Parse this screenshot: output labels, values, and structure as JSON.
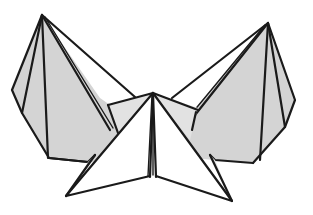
{
  "diagram": {
    "colors": {
      "background": "#ffffff",
      "shaded_face": "#d4d4d4",
      "light_face": "#e2e2e2",
      "white_face": "#ffffff",
      "line": "#1a1a1a"
    },
    "parts": [
      {
        "id": "left-pyramid",
        "label": "Left point"
      },
      {
        "id": "right-pyramid",
        "label": "Right point"
      },
      {
        "id": "center-point",
        "label": "Center point"
      },
      {
        "id": "left-flap",
        "label": "Left white flap"
      },
      {
        "id": "right-flap",
        "label": "Right white flap"
      }
    ]
  }
}
